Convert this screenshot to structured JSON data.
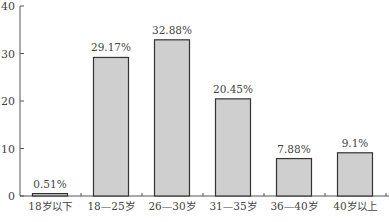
{
  "chart_data": {
    "type": "bar",
    "title": "",
    "xlabel": "",
    "ylabel": "",
    "categories": [
      "18岁以下",
      "18—25岁",
      "26—30岁",
      "31—35岁",
      "36—40岁",
      "40岁以上"
    ],
    "values": [
      0.51,
      29.17,
      32.88,
      20.45,
      7.88,
      9.1
    ],
    "value_labels": [
      "0.51%",
      "29.17%",
      "32.88%",
      "20.45%",
      "7.88%",
      "9.1%"
    ],
    "ylim": [
      0,
      40
    ],
    "yticks": [
      0,
      10,
      20,
      30,
      40
    ],
    "grid": false,
    "legend": null,
    "bar_color": "#cfcfcf",
    "bar_edge_color": "#333333"
  }
}
